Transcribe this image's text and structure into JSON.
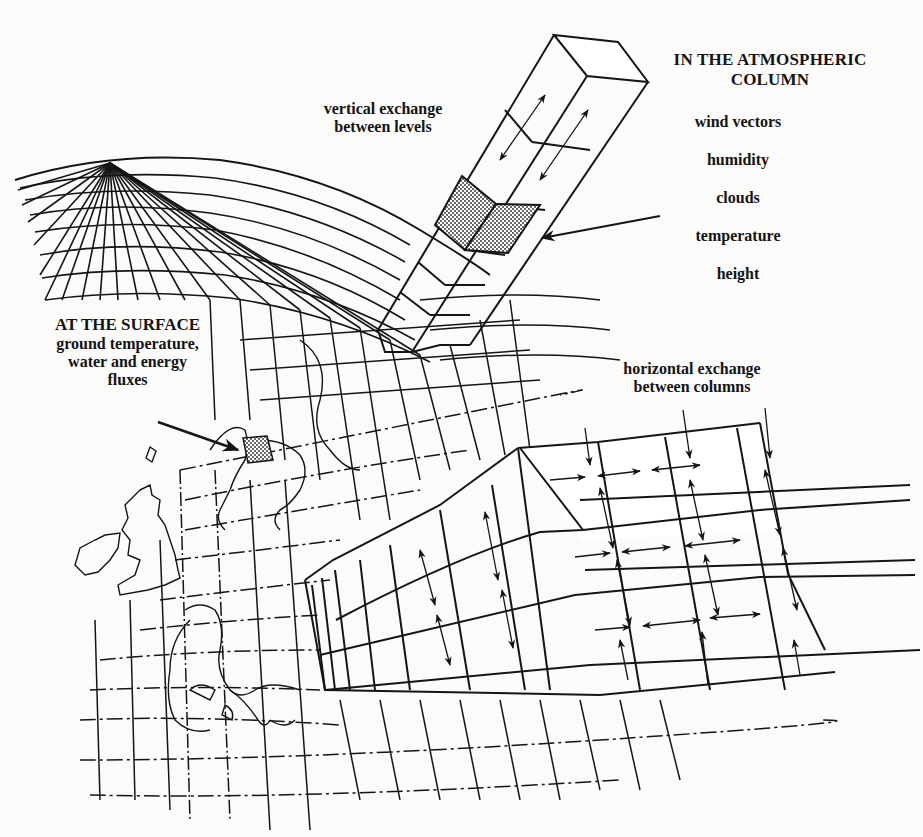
{
  "diagram": {
    "colors": {
      "ink": "#151515",
      "paper": "#fbfbfa",
      "shade": "#8a8a8a"
    },
    "labels": {
      "vertical_exchange": {
        "line1": "vertical exchange",
        "line2": "between levels"
      },
      "atmospheric_column": {
        "heading_line1": "IN THE ATMOSPHERIC",
        "heading_line2": "COLUMN",
        "variables": [
          "wind vectors",
          "humidity",
          "clouds",
          "temperature",
          "height"
        ]
      },
      "surface": {
        "heading": "AT THE SURFACE",
        "line1": "ground temperature,",
        "line2": "water and energy",
        "line3": "fluxes"
      },
      "horizontal_exchange": {
        "line1": "horizontal exchange",
        "line2": "between columns"
      }
    },
    "elements": {
      "globe_grid": "latitude-longitude grid over Northern Hemisphere",
      "europe_map": "coastline outline of Europe and the British Isles",
      "atmospheric_column": "3D column with stacked levels, one shaded cell",
      "surface_cell": "shaded grid cell at the surface",
      "horizontal_block": "3D grid slab with arrows between columns"
    }
  }
}
